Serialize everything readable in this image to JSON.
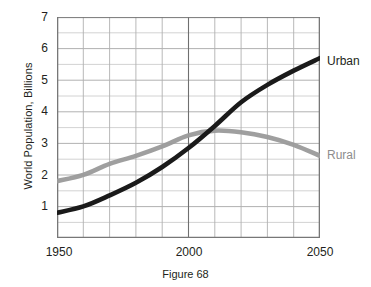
{
  "figure": {
    "caption": "Figure 68",
    "ylabel": "World Population, Billions"
  },
  "chart_data": {
    "type": "line",
    "title": "",
    "xlabel": "",
    "ylabel": "World Population, Billions",
    "xlim": [
      1950,
      2050
    ],
    "ylim": [
      0,
      7
    ],
    "xticks": [
      1950,
      2000,
      2050
    ],
    "xtick_labels": [
      "1950",
      "2000",
      "2050"
    ],
    "yticks": [
      1,
      2,
      3,
      4,
      5,
      6,
      7
    ],
    "ytick_labels": [
      "1",
      "2",
      "3",
      "4",
      "5",
      "6",
      "7"
    ],
    "grid": true,
    "grid_x_step": 10,
    "grid_y_step": 0.5,
    "legend": "inline-right-of-plot",
    "x": [
      1950,
      1960,
      1970,
      1980,
      1990,
      2000,
      2010,
      2020,
      2030,
      2040,
      2050
    ],
    "series": [
      {
        "name": "Urban",
        "color": "#1a1a1a",
        "label_position": "right-end",
        "values": [
          0.8,
          1.0,
          1.35,
          1.75,
          2.25,
          2.85,
          3.55,
          4.3,
          4.85,
          5.3,
          5.7
        ]
      },
      {
        "name": "Rural",
        "color": "#9a9a9a",
        "label_position": "right-end",
        "values": [
          1.8,
          2.0,
          2.35,
          2.6,
          2.9,
          3.25,
          3.4,
          3.35,
          3.2,
          2.95,
          2.6
        ]
      }
    ]
  },
  "axis_labels": {
    "y": [
      "7",
      "6",
      "5",
      "4",
      "3",
      "2",
      "1"
    ],
    "x": [
      "1950",
      "2000",
      "2050"
    ]
  },
  "series_labels": {
    "urban": "Urban",
    "rural": "Rural"
  },
  "colors": {
    "urban_line": "#1a1a1a",
    "rural_line": "#9a9a9a",
    "grid": "#b9b9b9",
    "grid_minor": "#d8d8d8",
    "axis": "#6b6b6b",
    "text": "#231f20"
  }
}
